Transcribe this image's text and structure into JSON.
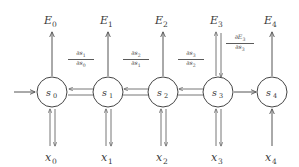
{
  "diagram": {
    "type": "recurrent-neural-network-unrolled",
    "colors": {
      "background": "#ffffff",
      "stroke": "#555555",
      "node_stroke": "#444444",
      "text": "#333333"
    },
    "nodes": [
      {
        "id": "s0",
        "base": "s",
        "sub": "0",
        "cx": 52,
        "cy": 92,
        "r": 15
      },
      {
        "id": "s1",
        "base": "s",
        "sub": "1",
        "cx": 108,
        "cy": 92,
        "r": 15
      },
      {
        "id": "s2",
        "base": "s",
        "sub": "2",
        "cx": 163,
        "cy": 92,
        "r": 15
      },
      {
        "id": "s3",
        "base": "s",
        "sub": "3",
        "cx": 218,
        "cy": 92,
        "r": 15
      },
      {
        "id": "s4",
        "base": "s",
        "sub": "4",
        "cx": 272,
        "cy": 92,
        "r": 15
      }
    ],
    "outputs": [
      {
        "id": "E0",
        "base": "E",
        "sub": "0",
        "x": 52,
        "y": 22,
        "double_arrow": false
      },
      {
        "id": "E1",
        "base": "E",
        "sub": "1",
        "x": 108,
        "y": 22,
        "double_arrow": false
      },
      {
        "id": "E2",
        "base": "E",
        "sub": "2",
        "x": 163,
        "y": 22,
        "double_arrow": false
      },
      {
        "id": "E3",
        "base": "E",
        "sub": "3",
        "x": 218,
        "y": 22,
        "double_arrow": true
      },
      {
        "id": "E4",
        "base": "E",
        "sub": "4",
        "x": 272,
        "y": 22,
        "double_arrow": false
      }
    ],
    "inputs": [
      {
        "id": "x0",
        "base": "x",
        "sub": "0",
        "x": 52,
        "y": 158,
        "double_arrow": true
      },
      {
        "id": "x1",
        "base": "x",
        "sub": "1",
        "x": 108,
        "y": 158,
        "double_arrow": true
      },
      {
        "id": "x2",
        "base": "x",
        "sub": "2",
        "x": 163,
        "y": 158,
        "double_arrow": true
      },
      {
        "id": "x3",
        "base": "x",
        "sub": "3",
        "x": 218,
        "y": 158,
        "double_arrow": true
      },
      {
        "id": "x4",
        "base": "x",
        "sub": "4",
        "x": 272,
        "y": 158,
        "double_arrow": false
      }
    ],
    "gradient_labels": [
      {
        "id": "ds1_ds0",
        "numerator": "∂s",
        "numerator_sub": "1",
        "denominator": "∂s",
        "denominator_sub": "0",
        "x": 80,
        "y": 56
      },
      {
        "id": "ds2_ds1",
        "numerator": "∂s",
        "numerator_sub": "2",
        "denominator": "∂s",
        "denominator_sub": "1",
        "x": 135,
        "y": 56
      },
      {
        "id": "ds3_ds2",
        "numerator": "∂s",
        "numerator_sub": "3",
        "denominator": "∂s",
        "denominator_sub": "2",
        "x": 190,
        "y": 56
      },
      {
        "id": "dE3_ds3",
        "numerator": "∂E",
        "numerator_sub": "3",
        "denominator": "∂s",
        "denominator_sub": "3",
        "x": 238,
        "y": 38
      }
    ],
    "recurrent_edges": [
      {
        "id": "s0-s1",
        "from": "s0",
        "to": "s1",
        "bidirectional": true
      },
      {
        "id": "s1-s2",
        "from": "s1",
        "to": "s2",
        "bidirectional": true
      },
      {
        "id": "s2-s3",
        "from": "s2",
        "to": "s3",
        "bidirectional": true
      },
      {
        "id": "s3-s4",
        "from": "s3",
        "to": "s4",
        "bidirectional": false
      }
    ],
    "initial_edge": {
      "id": "init-arrow",
      "x1": 14,
      "x2": 36,
      "y": 92
    }
  }
}
